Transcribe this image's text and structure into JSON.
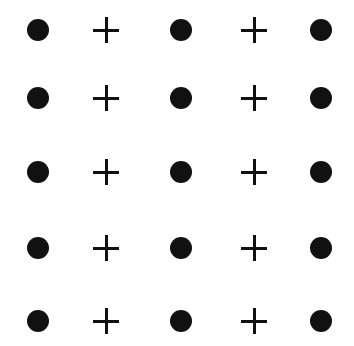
{
  "diagram": {
    "title": "",
    "grid": {
      "rows": 5,
      "cols": 5,
      "col_x": [
        38,
        106,
        181,
        254,
        321
      ],
      "row_y": [
        30,
        98,
        172,
        248,
        321
      ],
      "pattern_per_row": [
        "dot",
        "plus",
        "dot",
        "plus",
        "dot"
      ]
    },
    "colors": {
      "symbol": "#111111",
      "background": "#ffffff"
    }
  }
}
